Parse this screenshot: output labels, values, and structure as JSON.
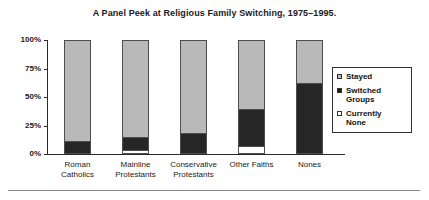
{
  "chart_data": {
    "type": "bar",
    "subtype": "stacked-vertical-percent",
    "title": "A Panel Peek at Religious Family Switching, 1975–1995.",
    "xlabel": "",
    "ylabel": "",
    "ylim": [
      0,
      100
    ],
    "y_tick_labels": [
      "100%",
      "75%",
      "50%",
      "25%",
      "0%"
    ],
    "y_tick_values": [
      100,
      75,
      50,
      25,
      0
    ],
    "grid": false,
    "legend_position": "right",
    "categories": [
      "Roman Catholics",
      "Mainline Protestants",
      "Conservative Protestants",
      "Other Faiths",
      "Nones"
    ],
    "category_lines": [
      [
        "Roman",
        "Catholics"
      ],
      [
        "Mainline",
        "Protestants"
      ],
      [
        "Conservative",
        "Protestants"
      ],
      [
        "Other Faiths",
        ""
      ],
      [
        "Nones",
        ""
      ]
    ],
    "series": [
      {
        "name": "Stayed",
        "color": "#b9b9b9",
        "values": [
          90,
          87,
          83,
          62,
          38
        ]
      },
      {
        "name": "Switched Groups",
        "color": "#262626",
        "values": [
          10,
          11,
          17,
          33,
          62
        ]
      },
      {
        "name": "Currently None",
        "color": "#ffffff",
        "values": [
          0,
          2,
          0,
          5,
          0
        ]
      }
    ],
    "legend": [
      {
        "label": "Stayed",
        "lines": [
          "Stayed",
          ""
        ],
        "swatch": "stayed"
      },
      {
        "label": "Switched Groups",
        "lines": [
          "Switched",
          "Groups"
        ],
        "swatch": "switched"
      },
      {
        "label": "Currently None",
        "lines": [
          "Currently",
          "None"
        ],
        "swatch": "none"
      }
    ],
    "colors": {
      "stayed": "#b9b9b9",
      "switched": "#262626",
      "currently_none": "#ffffff",
      "axis": "#2a2a2a",
      "bar_outline": "#4d4d4d",
      "text": "#1a1a1a"
    }
  }
}
